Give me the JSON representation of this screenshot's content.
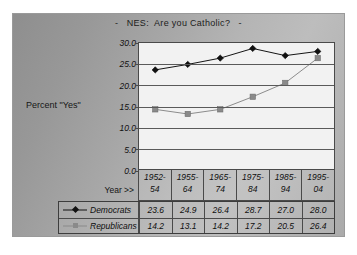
{
  "chart_data": {
    "type": "line",
    "title": "-   NES:  Are you Catholic?   -",
    "xlabel": "Year >>",
    "ylabel": "Percent \"Yes\"",
    "categories": [
      "1952-\n54",
      "1955-\n64",
      "1965-\n74",
      "1975-\n84",
      "1985-\n94",
      "1995-\n04"
    ],
    "yticks": [
      "30.0",
      "25.0",
      "20.0",
      "15.0",
      "10.0",
      "5.0",
      "0.0"
    ],
    "ylim": [
      0,
      30
    ],
    "grid": true,
    "legend_position": "data-table-below",
    "series": [
      {
        "name": "Democrats",
        "marker": "diamond",
        "color": "#111111",
        "values": [
          23.6,
          24.9,
          26.4,
          28.7,
          27.0,
          28.0
        ],
        "labels": [
          "23.6",
          "24.9",
          "26.4",
          "28.7",
          "27.0",
          "28.0"
        ]
      },
      {
        "name": "Republicans",
        "marker": "square",
        "color": "#8a8a8a",
        "values": [
          14.2,
          13.1,
          14.2,
          17.2,
          20.5,
          26.4
        ],
        "labels": [
          "14.2",
          "13.1",
          "14.2",
          "17.2",
          "20.5",
          "26.4"
        ]
      }
    ]
  },
  "colors": {
    "panel_background_dark": "#8e8e8e",
    "panel_background_light": "#bdbdbd",
    "plot_background": "#f2f2f2",
    "axis": "#4a4a4a",
    "gridline": "#5a5a5a",
    "democrats": "#111111",
    "republicans": "#8a8a8a"
  }
}
